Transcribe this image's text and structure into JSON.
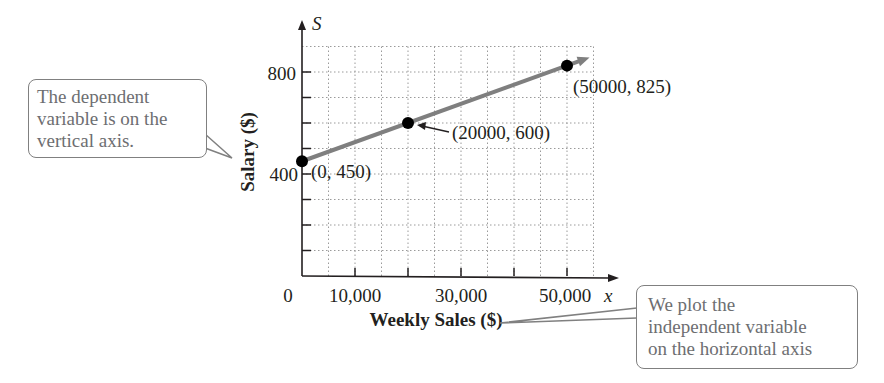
{
  "chart_data": {
    "type": "line",
    "title": "",
    "xlabel": "Weekly Sales ($)",
    "ylabel": "Salary ($)",
    "x_axis_var": "x",
    "y_axis_var": "S",
    "x_tick_labels": [
      "0",
      "10,000",
      "30,000",
      "50,000"
    ],
    "x_tick_values": [
      0,
      10000,
      30000,
      50000
    ],
    "x_ticks_marked": [
      10000,
      20000,
      30000,
      40000,
      50000
    ],
    "y_tick_labels": [
      "400",
      "800"
    ],
    "y_tick_values": [
      400,
      800
    ],
    "y_ticks_marked": [
      100,
      200,
      300,
      400,
      500,
      600,
      700,
      800
    ],
    "xlim": [
      0,
      55000
    ],
    "ylim": [
      0,
      900
    ],
    "grid": true,
    "grid_style": "dotted",
    "grid_step_x": 5000,
    "grid_step_y": 100,
    "series": [
      {
        "name": "Salary line",
        "color": "#7f7f7f",
        "x": [
          0,
          20000,
          50000
        ],
        "y": [
          450,
          600,
          825
        ],
        "extends_with_arrow": true
      }
    ],
    "points": [
      {
        "x": 0,
        "y": 450,
        "label": "(0, 450)"
      },
      {
        "x": 20000,
        "y": 600,
        "label": "(20000, 600)"
      },
      {
        "x": 50000,
        "y": 825,
        "label": "(50000, 825)"
      }
    ],
    "annotations": [
      {
        "text": "The dependent variable is on the vertical axis.",
        "points_to": "ylabel"
      },
      {
        "text": "We plot the independent variable on the horizontal axis",
        "points_to": "xlabel"
      }
    ]
  },
  "labels": {
    "y_var": "S",
    "x_var": "x",
    "y_tick_800": "800",
    "y_tick_400": "400",
    "x_tick_0": "0",
    "x_tick_10000": "10,000",
    "x_tick_30000": "30,000",
    "x_tick_50000": "50,000",
    "xlabel": "Weekly Sales ($)",
    "ylabel": "Salary ($)",
    "point_0": "(0, 450)",
    "point_1": "(20000, 600)",
    "point_2": "(50000, 825)"
  },
  "callouts": {
    "left": [
      "The dependent",
      "variable is on the",
      "vertical axis."
    ],
    "right": [
      "We plot the",
      "independent variable",
      "on the horizontal axis"
    ]
  }
}
